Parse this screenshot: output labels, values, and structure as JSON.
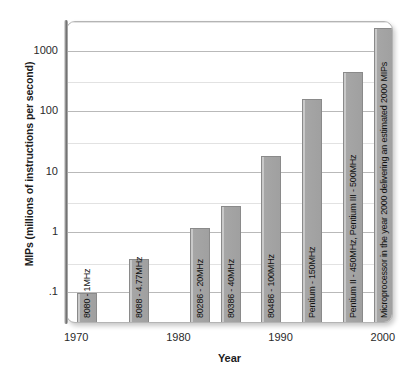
{
  "chart_data": {
    "type": "bar",
    "title": "",
    "xlabel": "Year",
    "ylabel": "MIPs (millions of instructions per second)",
    "yscale": "log",
    "ylim": [
      0.03,
      3000
    ],
    "xlim": [
      1969,
      2001
    ],
    "grid": true,
    "legend": "none",
    "y_ticks": [
      {
        "value": 1000,
        "label": "1000"
      },
      {
        "value": 100,
        "label": "100"
      },
      {
        "value": 10,
        "label": "10"
      },
      {
        "value": 1,
        "label": "1"
      },
      {
        "value": 0.1,
        "label": ".1"
      }
    ],
    "y_gridlines_minor": [
      3000,
      300,
      30,
      3,
      0.3
    ],
    "x_ticks": [
      {
        "value": 1970,
        "label": "1970"
      },
      {
        "value": 1980,
        "label": "1980"
      },
      {
        "value": 1990,
        "label": "1990"
      },
      {
        "value": 2000,
        "label": "2000"
      }
    ],
    "categories": [
      "8080 - 1MHz",
      "8088 - 4.77MHz",
      "80286 - 20MHz",
      "80386 - 40MHz",
      "80486 - 100MHz",
      "Pentium - 150MHz",
      "Pentium II - 450MHz, Pentium III - 500MHz",
      "Microprocessor in the year 2000 delivering an estimated 2000 MIPs"
    ],
    "values": [
      0.09,
      0.33,
      1.1,
      2.5,
      17,
      150,
      420,
      2200
    ],
    "bars": [
      {
        "label": "8080 - 1MHz",
        "year": 1971,
        "value": 0.09
      },
      {
        "label": "8088 - 4.77MHz",
        "year": 1976,
        "value": 0.33
      },
      {
        "label": "80286 - 20MHz",
        "year": 1982,
        "value": 1.1
      },
      {
        "label": "80386 - 40MHz",
        "year": 1985,
        "value": 2.5
      },
      {
        "label": "80486 - 100MHz",
        "year": 1989,
        "value": 17
      },
      {
        "label": "Pentium - 150MHz",
        "year": 1993,
        "value": 150
      },
      {
        "label": "Pentium II - 450MHz, Pentium III - 500MHz",
        "year": 1997,
        "value": 420
      },
      {
        "label": "Microprocessor in the year 2000 delivering an estimated 2000 MIPs",
        "year": 2000,
        "value": 2200
      }
    ],
    "bar_color": "#a0a0a0",
    "bar_edge_color": "#8a8a8a",
    "grid_color": "#b9b9b9",
    "background": "#ffffff"
  }
}
